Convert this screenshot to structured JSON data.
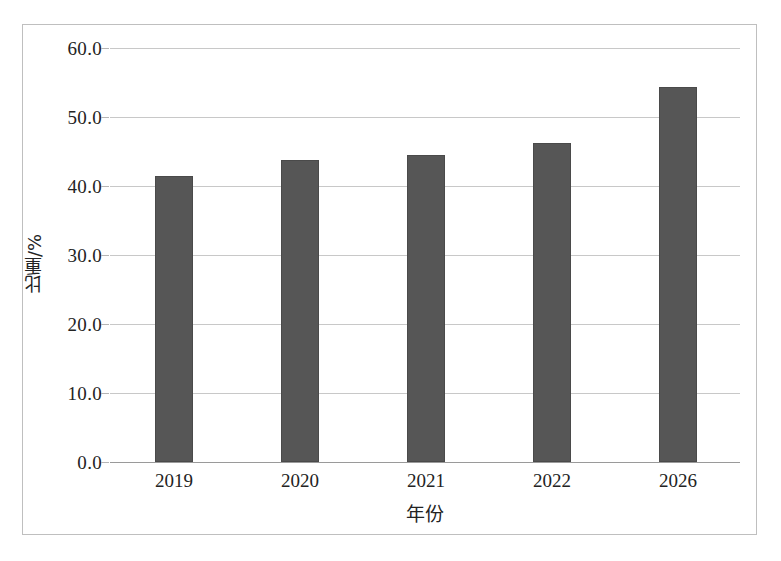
{
  "chart_data": {
    "type": "bar",
    "title": "",
    "subtitle": "",
    "xlabel": "年份",
    "ylabel": "比重/%",
    "categories": [
      "2019",
      "2020",
      "2021",
      "2022",
      "2026"
    ],
    "values": [
      41.4,
      43.8,
      44.5,
      46.3,
      54.3
    ],
    "series": [
      {
        "name": "比重",
        "values": [
          41.4,
          43.8,
          44.5,
          46.3,
          54.3
        ]
      }
    ],
    "ylim": [
      0.0,
      60.0
    ],
    "ytick_labels": [
      "60.0",
      "50.0",
      "40.0",
      "30.0",
      "20.0",
      "10.0",
      "0.0"
    ],
    "ytick_values": [
      60.0,
      50.0,
      40.0,
      30.0,
      20.0,
      10.0,
      0.0
    ],
    "ytick_step": 10.0,
    "grid": "horizontal",
    "legend": "none",
    "bar_color": "#565656",
    "gridline_color": "#c8c8c8",
    "frame_color": "#bfbfbf",
    "annotations": []
  }
}
